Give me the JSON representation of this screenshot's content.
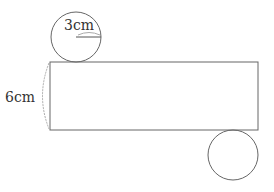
{
  "diagram": {
    "radius_label": "3cm",
    "height_label": "6cm",
    "stroke_color": "#666666",
    "rectangle": {
      "x": 50,
      "y": 62,
      "width": 208,
      "height": 68
    },
    "top_circle": {
      "cx": 76,
      "cy": 37,
      "r": 25
    },
    "bottom_circle": {
      "cx": 233,
      "cy": 155,
      "r": 25
    }
  }
}
